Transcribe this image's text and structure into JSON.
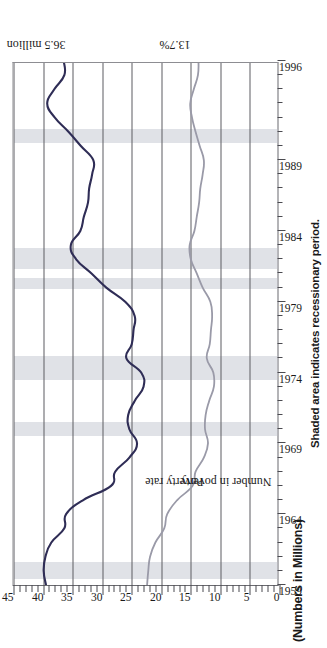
{
  "figure": {
    "title": "(Numbers in Millions)",
    "note": "Shaded area indicates recessionary period."
  },
  "annotations": {
    "peak_number": "36.5 million",
    "peak_rate": "13.7%",
    "series_label_number": "Number in poverty",
    "series_label_rate": "Poverty rate"
  },
  "colors": {
    "number_in_poverty_line": "#2f2d56",
    "poverty_rate_line": "#9a9aa8",
    "recession_band": "#cdd0d8",
    "gridline": "#5c5c62",
    "axis": "#4a4a50"
  },
  "chart_data": {
    "type": "line",
    "title": "(Numbers in Millions)",
    "subtitle": "Shaded area indicates recessionary period.",
    "xlabel": "",
    "ylabel": "(Numbers in Millions)",
    "xlim": [
      1959,
      1996
    ],
    "ylim": [
      0,
      45
    ],
    "grid": true,
    "legend": "inline-labels",
    "orientation": "rotated-90-ccw",
    "x_tick_labels": [
      "1959",
      "1964",
      "1969",
      "1974",
      "1979",
      "1984",
      "1989",
      "1996"
    ],
    "x_tick_values": [
      1959,
      1964,
      1969,
      1974,
      1979,
      1984,
      1989,
      1996
    ],
    "x_minor_ticks_every": 1,
    "y_tick_labels": [
      "0",
      "5",
      "10",
      "15",
      "20",
      "25",
      "30",
      "35",
      "40",
      "45"
    ],
    "y_tick_values": [
      0,
      5,
      10,
      15,
      20,
      25,
      30,
      35,
      40,
      45
    ],
    "x": [
      1959,
      1960,
      1961,
      1962,
      1963,
      1964,
      1965,
      1966,
      1967,
      1968,
      1969,
      1970,
      1971,
      1972,
      1973,
      1974,
      1975,
      1976,
      1977,
      1978,
      1979,
      1980,
      1981,
      1982,
      1983,
      1984,
      1985,
      1986,
      1987,
      1988,
      1989,
      1990,
      1991,
      1992,
      1993,
      1994,
      1995,
      1996
    ],
    "series": [
      {
        "name": "Number in poverty",
        "unit": "millions",
        "color": "#2f2d56",
        "values": [
          39.5,
          39.9,
          39.6,
          38.6,
          36.4,
          36.1,
          33.2,
          28.5,
          27.8,
          25.4,
          24.1,
          25.4,
          25.6,
          24.5,
          23.0,
          23.4,
          25.9,
          25.0,
          24.7,
          24.5,
          26.1,
          29.3,
          31.8,
          34.4,
          35.3,
          33.7,
          33.1,
          32.4,
          32.2,
          31.7,
          31.5,
          33.6,
          35.7,
          38.0,
          39.3,
          38.1,
          36.4,
          36.5
        ],
        "annotated_point": {
          "x": 1996,
          "value": 36.5,
          "label": "36.5 million"
        }
      },
      {
        "name": "Poverty rate",
        "unit": "percent",
        "color": "#9a9aa8",
        "values": [
          22.4,
          22.2,
          21.9,
          21.0,
          19.5,
          19.0,
          17.3,
          14.7,
          14.2,
          12.8,
          12.1,
          12.6,
          12.5,
          11.9,
          11.1,
          11.2,
          12.3,
          11.8,
          11.6,
          11.4,
          11.7,
          13.0,
          14.0,
          15.0,
          15.2,
          14.4,
          14.0,
          13.6,
          13.4,
          13.0,
          12.8,
          13.5,
          14.2,
          14.8,
          15.1,
          14.5,
          13.8,
          13.7
        ],
        "annotated_point": {
          "x": 1996,
          "value": 13.7,
          "label": "13.7%"
        }
      }
    ],
    "recession_bands": [
      {
        "start": 1959.4,
        "end": 1960.6
      },
      {
        "start": 1969.5,
        "end": 1970.5
      },
      {
        "start": 1973.5,
        "end": 1975.2
      },
      {
        "start": 1979.9,
        "end": 1980.7
      },
      {
        "start": 1981.3,
        "end": 1982.8
      },
      {
        "start": 1990.2,
        "end": 1991.2
      }
    ]
  }
}
